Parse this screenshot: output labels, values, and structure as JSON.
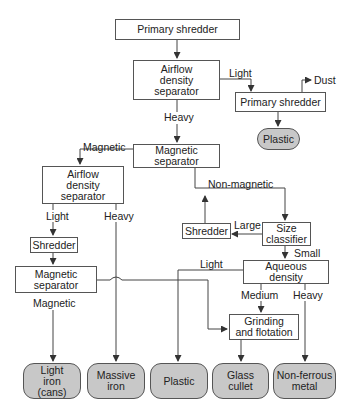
{
  "diagram": {
    "type": "process-flowchart",
    "nodes": {
      "primary_shredder_top": "Primary shredder",
      "airflow_separator_top": "Airflow density separator",
      "primary_shredder_right": "Primary shredder",
      "plastic_right": "Plastic",
      "magnetic_separator_center": "Magnetic separator",
      "airflow_separator_left": "Airflow density separator",
      "shredder_left": "Shredder",
      "magnetic_separator_left": "Magnetic separator",
      "size_classifier": "Size classifier",
      "shredder_right": "Shredder",
      "aqueous_density": "Aqueous density",
      "grinding_flotation": "Grinding and flotation"
    },
    "outputs": {
      "light_iron": "Light iron (cans)",
      "massive_iron": "Massive iron",
      "plastic": "Plastic",
      "glass_cullet": "Glass cullet",
      "non_ferrous_metal": "Non-ferrous metal"
    },
    "edge_labels": {
      "light_top": "Light",
      "dust": "Dust",
      "heavy_top": "Heavy",
      "magnetic_center": "Magnetic",
      "light_left": "Light",
      "heavy_left": "Heavy",
      "magnetic_left": "Magnetic",
      "non_magnetic": "Non-magnetic",
      "large": "Large",
      "small": "Small",
      "light_aqueous": "Light",
      "medium": "Medium",
      "heavy_aqueous": "Heavy"
    },
    "colors": {
      "line": "#444444",
      "box_fill": "#ffffff",
      "output_fill": "#c8c8c8"
    }
  }
}
